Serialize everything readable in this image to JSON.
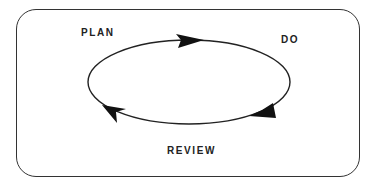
{
  "diagram": {
    "type": "cycle",
    "labels": {
      "plan": "PLAN",
      "do": "DO",
      "review": "REVIEW"
    },
    "flow": [
      "PLAN",
      "DO",
      "REVIEW"
    ],
    "direction": "clockwise",
    "colors": {
      "stroke": "#222222",
      "background": "#ffffff"
    }
  }
}
